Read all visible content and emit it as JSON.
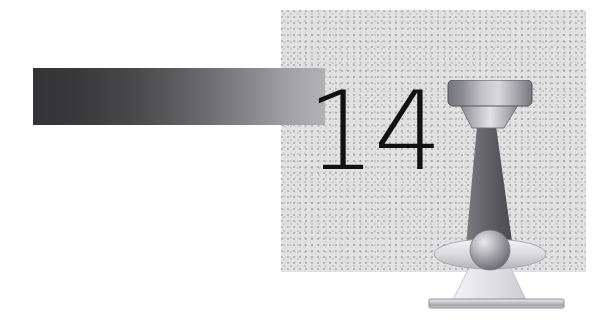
{
  "page": {
    "background_color": "#ffffff",
    "width": 613,
    "height": 327,
    "kind": "book-chapter-opener"
  },
  "chapter": {
    "number": "14",
    "number_color": "#111111"
  },
  "chapter_bar": {
    "label": "chapter-gradient-bar",
    "gradient_from": "#333335",
    "gradient_to": "#b2b2b5"
  },
  "texture_panel": {
    "label": "stippled-background-panel",
    "base_color": "#e2e2e2",
    "speckle_color": "#787878"
  },
  "illustration": {
    "title": "microscope-light-illustration",
    "parts": [
      {
        "name": "lamp-housing",
        "shape": "rounded-rectangle",
        "fill_from": "#6f6f73",
        "fill_to": "#d8d8dc"
      },
      {
        "name": "lamp-reflector-cone",
        "shape": "trapezoid",
        "fill_from": "#808084",
        "fill_to": "#e6e6ea"
      },
      {
        "name": "light-beam-upper",
        "shape": "tapered-cone",
        "fill_from": "#6c6c70",
        "fill_to": "#4b4b4f"
      },
      {
        "name": "lens-ellipse",
        "shape": "ellipse",
        "fill_from": "#f2f2f4",
        "fill_to": "#b9b9bd"
      },
      {
        "name": "specimen-sphere",
        "shape": "sphere",
        "fill_highlight": "#e8e8ea",
        "fill_shadow": "#6e6e74"
      },
      {
        "name": "light-beam-lower",
        "shape": "flared-cone",
        "fill_from": "#f4f4f6",
        "fill_to": "#cfcfd3"
      },
      {
        "name": "stage-bar",
        "shape": "bar",
        "fill_from": "#e9e9eb",
        "fill_to": "#9a9a9e"
      }
    ]
  }
}
